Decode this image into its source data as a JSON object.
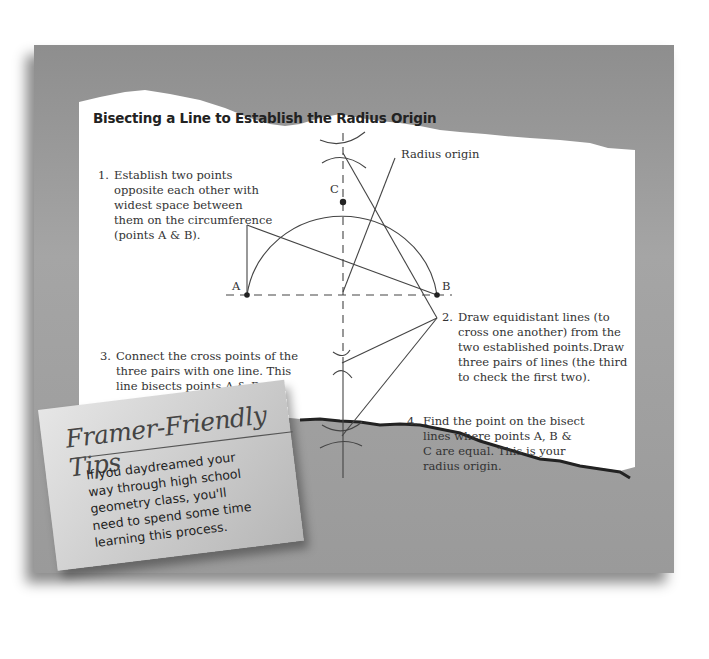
{
  "title": "Bisecting a Line to Establish the Radius Origin",
  "labels": {
    "radius_origin": "Radius origin",
    "point_a": "A",
    "point_b": "B",
    "point_c": "C"
  },
  "steps": [
    {
      "num": "1.",
      "lines": [
        "Establish two points",
        "opposite each other with",
        "widest space between",
        "them on the circumference",
        "(points A & B)."
      ]
    },
    {
      "num": "2.",
      "lines": [
        "Draw equidistant lines (to",
        "cross one another) from the",
        "two established points.Draw",
        "three pairs of lines (the third",
        "to check the first two)."
      ]
    },
    {
      "num": "3.",
      "lines": [
        "Connect the cross points of the",
        "three pairs with one line. This",
        "line bisects points A & B."
      ]
    },
    {
      "num": "4.",
      "lines": [
        "Find the point on the bisect",
        "lines where points A, B &",
        "C are equal. This is your",
        "radius origin."
      ]
    }
  ],
  "tip": {
    "heading": "Framer-Friendly Tips",
    "lines": [
      "If you daydreamed your",
      "way through high school",
      "geometry class, you'll",
      "need to spend some time",
      "learning this process."
    ]
  }
}
